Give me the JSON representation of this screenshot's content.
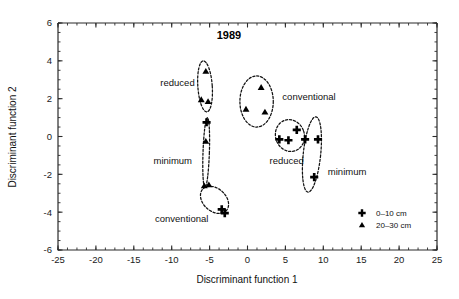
{
  "chart_data": {
    "type": "scatter",
    "title": "1989",
    "xlabel": "Discriminant function 1",
    "ylabel": "Discriminant function 2",
    "xlim": [
      -25,
      25
    ],
    "ylim": [
      -6,
      6
    ],
    "xticks": [
      -25,
      -20,
      -15,
      -10,
      -5,
      0,
      5,
      10,
      15,
      20,
      25
    ],
    "xtick_labels": [
      "-25",
      "-20",
      "-15",
      "-10",
      "-5",
      "0",
      "5",
      "10",
      "15",
      "20",
      "25"
    ],
    "yticks": [
      -6,
      -4,
      -2,
      0,
      2,
      4,
      6
    ],
    "ytick_labels": [
      "-6",
      "-4",
      "-2",
      "0",
      "2",
      "4",
      "6"
    ],
    "x_minor_interval": 1.25,
    "y_minor_interval": 0.5,
    "grid": false,
    "legend_position": "bottom-right",
    "legend": [
      {
        "label": "0–10 cm",
        "marker": "cross"
      },
      {
        "label": "20–30 cm",
        "marker": "triangle"
      }
    ],
    "series": [
      {
        "name": "0–10 cm",
        "marker": "cross",
        "points": [
          {
            "x": -3.4,
            "y": -3.85
          },
          {
            "x": -3.0,
            "y": -4.05
          },
          {
            "x": 4.2,
            "y": -0.15
          },
          {
            "x": 5.4,
            "y": -0.2
          },
          {
            "x": 6.5,
            "y": 0.35
          },
          {
            "x": 7.6,
            "y": -0.15
          },
          {
            "x": 9.3,
            "y": -0.15
          },
          {
            "x": 8.8,
            "y": -2.15
          },
          {
            "x": -5.4,
            "y": 0.75
          }
        ]
      },
      {
        "name": "20–30 cm",
        "marker": "triangle",
        "points": [
          {
            "x": -5.5,
            "y": 3.45
          },
          {
            "x": -6.1,
            "y": 1.95
          },
          {
            "x": -5.2,
            "y": 1.85
          },
          {
            "x": -5.5,
            "y": -0.25
          },
          {
            "x": 1.8,
            "y": 2.6
          },
          {
            "x": -0.2,
            "y": 1.45
          },
          {
            "x": 2.3,
            "y": 1.3
          },
          {
            "x": -5.7,
            "y": -2.6
          },
          {
            "x": -5.1,
            "y": -2.55
          }
        ]
      }
    ],
    "clusters": [
      {
        "label": "reduced",
        "tillage": "reduced",
        "depth": "20–30 cm",
        "cx": -5.6,
        "cy": 2.65,
        "rx": 0.95,
        "ry": 1.35,
        "rotation": -4,
        "label_x": -11.5,
        "label_y": 2.85,
        "label_anchor": "start"
      },
      {
        "label": "minimum",
        "tillage": "minimum",
        "depth": "20–30 cm",
        "cx": -5.45,
        "cy": -0.85,
        "rx": 0.42,
        "ry": 1.85,
        "rotation": 2,
        "label_x": -12.4,
        "label_y": -1.25,
        "label_anchor": "start"
      },
      {
        "label": "conventional",
        "tillage": "conventional",
        "depth": "mixed",
        "cx": -4.35,
        "cy": -3.35,
        "rx": 2.1,
        "ry": 0.6,
        "rotation": 42,
        "label_x": -12.2,
        "label_y": -4.35,
        "label_anchor": "start"
      },
      {
        "label": "conventional",
        "tillage": "conventional",
        "depth": "20–30 cm",
        "cx": 1.2,
        "cy": 1.85,
        "rx": 2.2,
        "ry": 1.35,
        "rotation": 0,
        "label_x": 4.6,
        "label_y": 2.1,
        "label_anchor": "start"
      },
      {
        "label": "reduced",
        "tillage": "reduced",
        "depth": "0–10 cm",
        "cx": 5.6,
        "cy": 0.05,
        "rx": 1.9,
        "ry": 0.85,
        "rotation": -18,
        "label_x": 2.9,
        "label_y": -1.25,
        "label_anchor": "start"
      },
      {
        "label": "minimum",
        "tillage": "minimum",
        "depth": "0–10 cm",
        "cx": 8.5,
        "cy": -0.95,
        "rx": 1.15,
        "ry": 2.0,
        "rotation": 6,
        "label_x": 10.6,
        "label_y": -1.85,
        "label_anchor": "start"
      }
    ]
  },
  "figure": {
    "title": "1989",
    "xlabel": "Discriminant function 1",
    "ylabel": "Discriminant function 2"
  }
}
